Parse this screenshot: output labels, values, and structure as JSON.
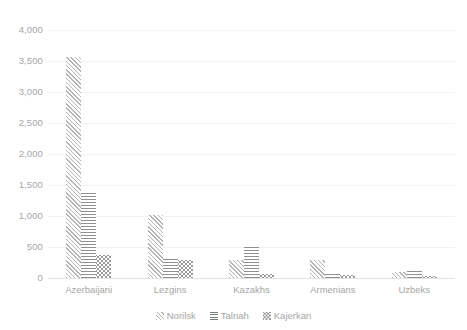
{
  "chart_data": {
    "type": "bar",
    "title": "",
    "subtitle": "",
    "xlabel": "",
    "ylabel": "",
    "categories": [
      "Azerbaijani",
      "Lezgins",
      "Kazakhs",
      "Armenians",
      "Uzbeks"
    ],
    "series": [
      {
        "name": "Norilsk",
        "values": [
          3570,
          1015,
          290,
          290,
          90
        ]
      },
      {
        "name": "Talnah",
        "values": [
          1370,
          300,
          520,
          75,
          110
        ]
      },
      {
        "name": "Kajerkan",
        "values": [
          370,
          290,
          60,
          50,
          35
        ]
      }
    ],
    "ylim": [
      0,
      4000
    ],
    "ytick_values": [
      0,
      500,
      1000,
      1500,
      2000,
      2500,
      3000,
      3500,
      4000
    ],
    "ytick_labels": [
      "0",
      "500",
      "1,000",
      "1,500",
      "2,000",
      "2,500",
      "3,000",
      "3,500",
      "4,000"
    ],
    "grid": true,
    "grid_axis": "y",
    "legend_position": "bottom",
    "legend_entries": [
      {
        "label": "Norilsk",
        "marker": "diagonal-hatch-swatch"
      },
      {
        "label": "Talnah",
        "marker": "horizontal-lines-swatch"
      },
      {
        "label": "Kajerkan",
        "marker": "dotted-swatch"
      }
    ],
    "colors": {
      "grid": "#f2f2f2",
      "axis": "#e3e3e3",
      "text": "#a6a6a6",
      "series_norilsk": "#b4b4b4",
      "series_talnah": "#8f8f8f",
      "series_kajerkan": "#9a9a9a"
    }
  }
}
